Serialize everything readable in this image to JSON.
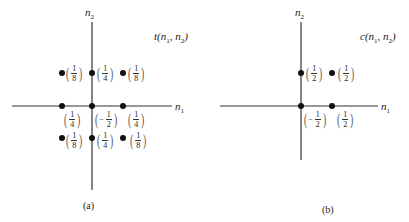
{
  "panels": [
    {
      "id": "a",
      "title": "t(n1, n2)",
      "title_func": "t",
      "caption": "(a)",
      "axis_x_label": "n",
      "axis_x_sub": "1",
      "axis_y_label": "n",
      "axis_y_sub": "2",
      "points": [
        {
          "n1": -1,
          "n2": 1,
          "sign": "",
          "num": "1",
          "den": "8"
        },
        {
          "n1": 0,
          "n2": 1,
          "sign": "",
          "num": "1",
          "den": "4"
        },
        {
          "n1": 1,
          "n2": 1,
          "sign": "",
          "num": "1",
          "den": "8"
        },
        {
          "n1": -1,
          "n2": 0,
          "sign": "",
          "num": "1",
          "den": "4"
        },
        {
          "n1": 0,
          "n2": 0,
          "sign": "−",
          "num": "1",
          "den": "2"
        },
        {
          "n1": 1,
          "n2": 0,
          "sign": "",
          "num": "1",
          "den": "4"
        },
        {
          "n1": -1,
          "n2": -1,
          "sign": "",
          "num": "1",
          "den": "8"
        },
        {
          "n1": 0,
          "n2": -1,
          "sign": "",
          "num": "1",
          "den": "4"
        },
        {
          "n1": 1,
          "n2": -1,
          "sign": "",
          "num": "1",
          "den": "8"
        }
      ]
    },
    {
      "id": "b",
      "title": "c(n1, n2)",
      "title_func": "c",
      "caption": "(b)",
      "axis_x_label": "n",
      "axis_x_sub": "1",
      "axis_y_label": "n",
      "axis_y_sub": "2",
      "points": [
        {
          "n1": 0,
          "n2": 1,
          "sign": "",
          "num": "1",
          "den": "2"
        },
        {
          "n1": 1,
          "n2": 1,
          "sign": "",
          "num": "1",
          "den": "2"
        },
        {
          "n1": 0,
          "n2": 0,
          "sign": "−",
          "num": "1",
          "den": "2"
        },
        {
          "n1": 1,
          "n2": 0,
          "sign": "",
          "num": "1",
          "den": "2"
        }
      ]
    }
  ],
  "labels": {
    "a_title_func": "t",
    "a_title_args_open": "(",
    "a_title_n": "n",
    "a_title_sub1": "1",
    "a_title_sep": ", ",
    "a_title_sub2": "2",
    "a_title_close": ")",
    "b_title_func": "c",
    "a_caption": "(a)",
    "b_caption": "(b)",
    "n": "n",
    "sub1": "1",
    "sub2": "2",
    "paren_open": "(",
    "paren_close": ")",
    "minus": "−",
    "one": "1",
    "two": "2",
    "four": "4",
    "eight": "8"
  }
}
